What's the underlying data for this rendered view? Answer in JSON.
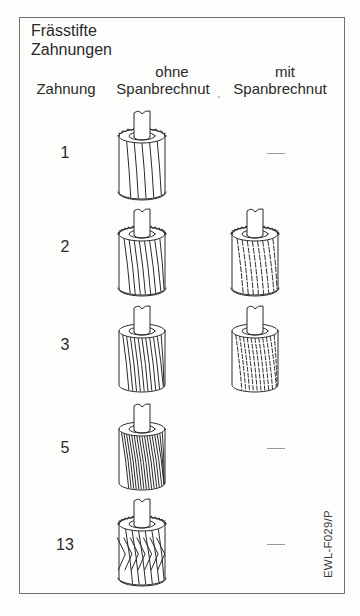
{
  "figure": {
    "title_line1": "Frässtifte",
    "title_line2": "Zahnungen",
    "columns": {
      "number": "Zahnung",
      "without_top": "ohne",
      "without_bottom": "Spanbrechnut",
      "with_top": "mit",
      "with_bottom": "Spanbrechnut"
    },
    "rows": [
      {
        "zahnung": "1",
        "ohne": "cutter-coarse-straight-flutes",
        "mit": "—"
      },
      {
        "zahnung": "2",
        "ohne": "cutter-medium-helical-flutes",
        "mit": "cutter-medium-chipbreaker"
      },
      {
        "zahnung": "3",
        "ohne": "cutter-fine-helical-flutes",
        "mit": "cutter-fine-chipbreaker"
      },
      {
        "zahnung": "5",
        "ohne": "cutter-extra-fine-helical-flutes",
        "mit": "—"
      },
      {
        "zahnung": "13",
        "ohne": "cutter-diamond-cross-cut",
        "mit": "—"
      }
    ],
    "reference_code": "EWL-F029/P"
  },
  "colors": {
    "line": "#2a2a2a",
    "border": "#707070",
    "dash": "#9a9a9a"
  }
}
